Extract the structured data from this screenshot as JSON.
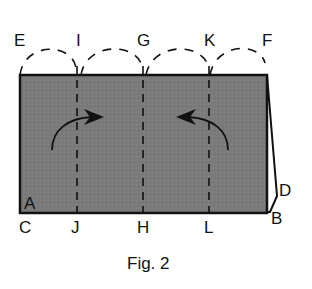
{
  "figure": {
    "caption": "Fig. 2",
    "colors": {
      "paper_fill": "#7a7a7a",
      "outline": "#111111",
      "background": "#ffffff"
    },
    "labels": {
      "top": [
        {
          "id": "E",
          "text": "E"
        },
        {
          "id": "I",
          "text": "I"
        },
        {
          "id": "G",
          "text": "G"
        },
        {
          "id": "K",
          "text": "K"
        },
        {
          "id": "F",
          "text": "F"
        }
      ],
      "bottom": [
        {
          "id": "C",
          "text": "C"
        },
        {
          "id": "J",
          "text": "J"
        },
        {
          "id": "H",
          "text": "H"
        },
        {
          "id": "L",
          "text": "L"
        }
      ],
      "corner_A": "A",
      "corner_B": "B",
      "corner_D": "D"
    },
    "fold_lines": [
      {
        "from": "I",
        "to": "J",
        "style": "dashed"
      },
      {
        "from": "G",
        "to": "H",
        "style": "dashed"
      },
      {
        "from": "K",
        "to": "L",
        "style": "dashed"
      }
    ],
    "fold_arcs": [
      {
        "from": "E",
        "to": "I"
      },
      {
        "from": "I",
        "to": "G"
      },
      {
        "from": "G",
        "to": "K"
      },
      {
        "from": "K",
        "to": "F"
      }
    ],
    "arrows": [
      {
        "name": "fold-left-arrow",
        "direction": "right"
      },
      {
        "name": "fold-right-arrow",
        "direction": "left"
      }
    ]
  }
}
